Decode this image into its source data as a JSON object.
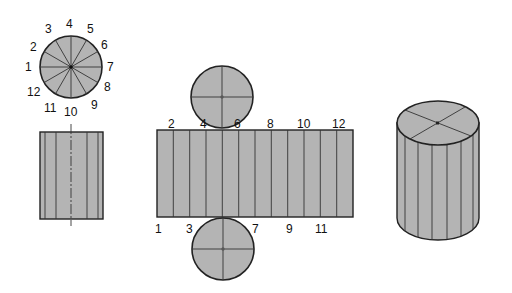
{
  "colors": {
    "fill": "#b4b4b4",
    "stroke": "#222222",
    "background": "#ffffff"
  },
  "top_view": {
    "title": "Cylinder top view (12 divisions)",
    "labels": [
      "1",
      "2",
      "3",
      "4",
      "5",
      "6",
      "7",
      "8",
      "9",
      "10",
      "11",
      "12"
    ]
  },
  "front_view": {
    "title": "Cylinder front view"
  },
  "development": {
    "title": "Cylinder surface development",
    "top_labels": [
      "2",
      "4",
      "6",
      "8",
      "10",
      "12"
    ],
    "bottom_labels": [
      "1",
      "3",
      "7",
      "9",
      "11"
    ]
  },
  "pictorial": {
    "title": "Cylinder pictorial view"
  }
}
